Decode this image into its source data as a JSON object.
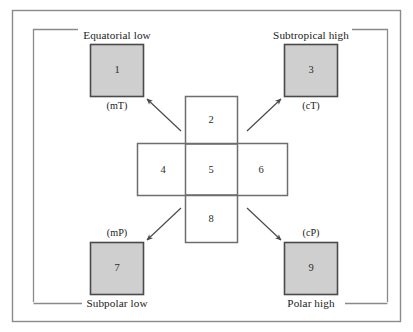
{
  "figure": {
    "type": "diagram",
    "colors": {
      "outer_border": "#8a8a8a",
      "bracket_line": "#8a8a8a",
      "shaded_box_fill": "#cfcfcf",
      "shaded_box_stroke": "#4a4a4a",
      "open_box_stroke": "#6e6e6e",
      "arrow": "#4a4a4a",
      "text": "#1a1a1a",
      "background": "#ffffff"
    }
  },
  "source_regions": [
    {
      "id": "equatorial-low",
      "number": "1",
      "region_label": "Equatorial low",
      "air_mass_code": "(mT)",
      "label_position": "above",
      "code_position": "below",
      "corner": "top-left"
    },
    {
      "id": "subtropical-high",
      "number": "3",
      "region_label": "Subtropical high",
      "air_mass_code": "(cT)",
      "label_position": "above",
      "code_position": "below",
      "corner": "top-right"
    },
    {
      "id": "subpolar-low",
      "number": "7",
      "region_label": "Subpolar low",
      "air_mass_code": "(mP)",
      "label_position": "below",
      "code_position": "above",
      "corner": "bottom-left"
    },
    {
      "id": "polar-high",
      "number": "9",
      "region_label": "Polar high",
      "air_mass_code": "(cP)",
      "label_position": "below",
      "code_position": "above",
      "corner": "bottom-right"
    }
  ],
  "center_cross": {
    "vertical_cells": [
      {
        "id": "cell-2",
        "number": "2",
        "position": "top"
      },
      {
        "id": "cell-5",
        "number": "5",
        "position": "center"
      },
      {
        "id": "cell-8",
        "number": "8",
        "position": "bottom"
      }
    ],
    "horizontal_cells": [
      {
        "id": "cell-4",
        "number": "4",
        "position": "left"
      },
      {
        "id": "cell-6",
        "number": "6",
        "position": "right"
      }
    ]
  },
  "arrows": [
    {
      "id": "arrow-to-1",
      "from": "center-cross",
      "to": "box-1",
      "direction": "up-left"
    },
    {
      "id": "arrow-to-3",
      "from": "center-cross",
      "to": "box-3",
      "direction": "up-right"
    },
    {
      "id": "arrow-to-7",
      "from": "center-cross",
      "to": "box-7",
      "direction": "down-left"
    },
    {
      "id": "arrow-to-9",
      "from": "center-cross",
      "to": "box-9",
      "direction": "down-right"
    }
  ]
}
